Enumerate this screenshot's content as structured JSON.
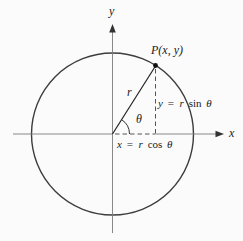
{
  "diagram": {
    "labels": {
      "point": "P(x, y)",
      "radius": "r",
      "angle": "θ",
      "x_axis": "x",
      "y_axis": "y"
    },
    "equations": {
      "y": {
        "lhs": "y",
        "eq": "=",
        "coef": "r",
        "fn": "sin",
        "arg": "θ"
      },
      "x": {
        "lhs": "x",
        "eq": "=",
        "coef": "r",
        "fn": "cos",
        "arg": "θ"
      }
    },
    "colors": {
      "circle_stroke": "#3d3d3d",
      "axis_stroke": "#7a7a7a",
      "line_stroke": "#222222",
      "dash_stroke": "#555555",
      "text": "#1a1a1a",
      "background": "#fbfbfb"
    }
  }
}
